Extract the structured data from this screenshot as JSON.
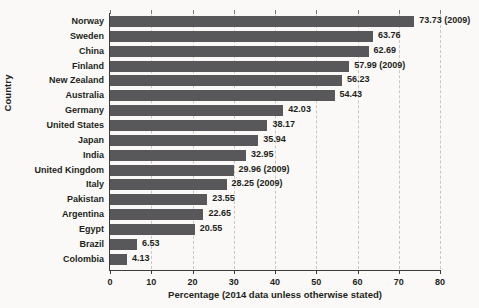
{
  "chart_data": {
    "type": "bar",
    "orientation": "horizontal",
    "title": "",
    "xlabel": "Percentage (2014 data unless otherwise stated)",
    "ylabel": "Country",
    "xlim": [
      0,
      80
    ],
    "xticks": [
      0,
      10,
      20,
      30,
      40,
      50,
      60,
      70,
      80
    ],
    "xtick_labels": [
      "0",
      "10",
      "20",
      "30",
      "40",
      "50",
      "60",
      "70",
      "80"
    ],
    "grid": "vertical-dashed",
    "legend": "none",
    "bar_color": "#58585a",
    "background_color": "#faf9f7",
    "text_color": "#231f20",
    "categories": [
      "Norway",
      "Sweden",
      "China",
      "Finland",
      "New Zealand",
      "Australia",
      "Germany",
      "United States",
      "Japan",
      "India",
      "United Kingdom",
      "Italy",
      "Pakistan",
      "Argentina",
      "Egypt",
      "Brazil",
      "Colombia"
    ],
    "values": [
      73.73,
      63.76,
      62.69,
      57.99,
      56.23,
      54.43,
      42.03,
      38.17,
      35.94,
      32.95,
      29.96,
      28.25,
      23.55,
      22.65,
      20.55,
      6.53,
      4.13
    ],
    "value_labels": [
      "73.73 (2009)",
      "63.76",
      "62.69",
      "57.99 (2009)",
      "56.23",
      "54.43",
      "42.03",
      "38.17",
      "35.94",
      "32.95",
      "29.96 (2009)",
      "28.25 (2009)",
      "23.55",
      "22.65",
      "20.55",
      "6.53",
      "4.13"
    ]
  }
}
